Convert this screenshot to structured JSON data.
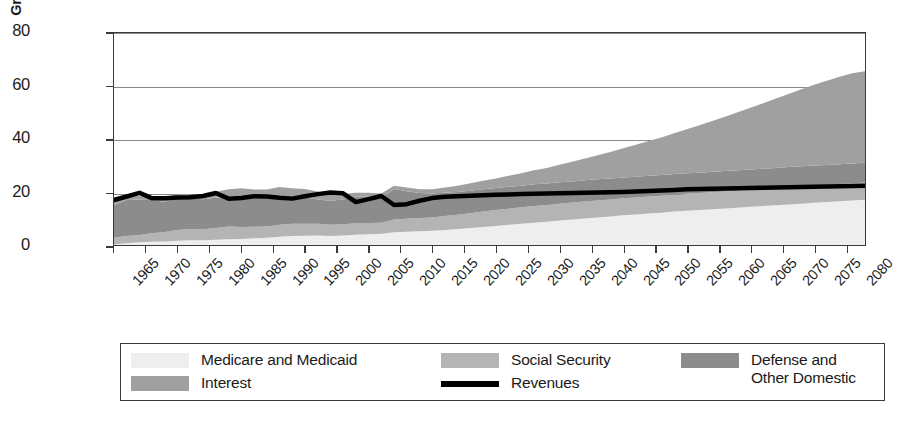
{
  "chart_data": {
    "type": "area",
    "title": "",
    "xlabel": "",
    "ylabel": "Percentage of\nGross Domestic Product",
    "ylabel_line1": "Percentage of",
    "ylabel_line2": "Gross Domestic Product",
    "xlim": [
      1965,
      2083
    ],
    "ylim": [
      0,
      80
    ],
    "grid": true,
    "stacked": true,
    "legend_position": "below-plot",
    "y_ticks": [
      0,
      20,
      40,
      60,
      80
    ],
    "x_ticks": [
      1965,
      1970,
      1975,
      1980,
      1985,
      1990,
      1995,
      2000,
      2005,
      2010,
      2015,
      2020,
      2025,
      2030,
      2035,
      2040,
      2045,
      2050,
      2055,
      2060,
      2065,
      2070,
      2075,
      2080
    ],
    "colors": {
      "medicare_and_medicaid": "#eeeeee",
      "social_security": "#b4b4b4",
      "defense_and_other_domestic": "#8c8c8c",
      "interest": "#a0a0a0",
      "revenues": "#000000",
      "gridline": "#8a8a8a",
      "frame": "#3a3a3a"
    },
    "x": [
      1965,
      1967,
      1969,
      1971,
      1973,
      1975,
      1977,
      1979,
      1981,
      1983,
      1985,
      1987,
      1989,
      1991,
      1993,
      1995,
      1997,
      1999,
      2001,
      2003,
      2005,
      2007,
      2009,
      2011,
      2013,
      2015,
      2017,
      2019,
      2021,
      2023,
      2025,
      2027,
      2029,
      2031,
      2033,
      2035,
      2037,
      2039,
      2041,
      2043,
      2045,
      2047,
      2049,
      2051,
      2053,
      2055,
      2057,
      2059,
      2061,
      2063,
      2065,
      2067,
      2069,
      2071,
      2073,
      2075,
      2077,
      2079,
      2081,
      2083
    ],
    "series": [
      {
        "name": "Medicare and Medicaid",
        "stack_order": 1,
        "color": "#eeeeee",
        "values": [
          0.2,
          0.7,
          1.0,
          1.2,
          1.3,
          1.6,
          1.8,
          1.8,
          2.0,
          2.2,
          2.3,
          2.5,
          2.7,
          3.1,
          3.4,
          3.5,
          3.6,
          3.4,
          3.6,
          3.9,
          4.1,
          4.2,
          4.8,
          5.0,
          5.2,
          5.4,
          5.7,
          6.0,
          6.4,
          6.8,
          7.2,
          7.6,
          8.0,
          8.4,
          8.8,
          9.2,
          9.6,
          10.0,
          10.4,
          10.8,
          11.2,
          11.5,
          11.9,
          12.2,
          12.6,
          12.9,
          13.2,
          13.5,
          13.8,
          14.1,
          14.4,
          14.7,
          15.0,
          15.3,
          15.6,
          15.9,
          16.2,
          16.5,
          16.8,
          17.1
        ]
      },
      {
        "name": "Social Security",
        "stack_order": 2,
        "color": "#b4b4b4",
        "values": [
          2.5,
          2.7,
          2.8,
          3.2,
          3.6,
          4.1,
          4.2,
          4.1,
          4.4,
          4.8,
          4.5,
          4.4,
          4.3,
          4.5,
          4.6,
          4.5,
          4.4,
          4.2,
          4.2,
          4.3,
          4.2,
          4.2,
          4.8,
          4.9,
          5.0,
          5.0,
          5.2,
          5.4,
          5.6,
          5.8,
          6.0,
          6.1,
          6.2,
          6.3,
          6.3,
          6.4,
          6.4,
          6.4,
          6.4,
          6.4,
          6.4,
          6.4,
          6.4,
          6.4,
          6.4,
          6.4,
          6.4,
          6.4,
          6.4,
          6.4,
          6.5,
          6.5,
          6.5,
          6.5,
          6.5,
          6.5,
          6.5,
          6.5,
          6.5,
          6.5
        ]
      },
      {
        "name": "Defense and Other Domestic",
        "stack_order": 3,
        "color": "#8c8c8c",
        "values": [
          12.4,
          13.6,
          13.4,
          12.5,
          11.4,
          12.1,
          11.6,
          11.4,
          11.4,
          11.4,
          11.5,
          11.0,
          10.7,
          11.0,
          10.4,
          9.9,
          9.2,
          9.1,
          9.4,
          10.1,
          9.9,
          9.3,
          11.5,
          10.4,
          9.4,
          9.0,
          8.8,
          8.6,
          8.5,
          8.4,
          8.3,
          8.3,
          8.2,
          8.2,
          8.1,
          8.1,
          8.0,
          8.0,
          8.0,
          7.9,
          7.9,
          7.9,
          7.8,
          7.8,
          7.8,
          7.8,
          7.7,
          7.7,
          7.7,
          7.7,
          7.6,
          7.6,
          7.6,
          7.6,
          7.6,
          7.6,
          7.5,
          7.5,
          7.5,
          7.5
        ]
      },
      {
        "name": "Interest",
        "stack_order": 4,
        "color": "#a0a0a0",
        "values": [
          1.3,
          1.3,
          1.4,
          1.4,
          1.4,
          1.5,
          1.5,
          1.7,
          2.3,
          2.6,
          3.1,
          3.0,
          3.2,
          3.3,
          3.0,
          3.2,
          3.0,
          2.5,
          2.0,
          1.4,
          1.5,
          1.7,
          1.3,
          1.4,
          1.4,
          1.6,
          2.0,
          2.4,
          2.8,
          3.2,
          3.6,
          4.1,
          4.7,
          5.3,
          5.9,
          6.6,
          7.4,
          8.2,
          9.1,
          10.0,
          11.0,
          12.0,
          13.1,
          14.2,
          15.4,
          16.6,
          17.9,
          19.2,
          20.5,
          21.9,
          23.3,
          24.7,
          26.2,
          27.6,
          29.1,
          30.5,
          31.8,
          33.0,
          34.0,
          34.5
        ]
      }
    ],
    "line_series": {
      "name": "Revenues",
      "color": "#000000",
      "values": [
        17.0,
        18.3,
        19.7,
        17.6,
        17.6,
        17.9,
        18.0,
        18.5,
        19.6,
        17.5,
        17.7,
        18.4,
        18.3,
        17.8,
        17.5,
        18.4,
        19.2,
        19.8,
        19.5,
        16.2,
        17.3,
        18.5,
        15.1,
        15.4,
        16.7,
        17.7,
        18.2,
        18.4,
        18.6,
        18.8,
        19.0,
        19.1,
        19.2,
        19.3,
        19.4,
        19.5,
        19.6,
        19.7,
        19.8,
        19.9,
        20.0,
        20.2,
        20.4,
        20.6,
        20.8,
        21.0,
        21.1,
        21.2,
        21.3,
        21.4,
        21.5,
        21.6,
        21.7,
        21.8,
        21.9,
        22.0,
        22.1,
        22.2,
        22.3,
        22.4
      ]
    },
    "legend": [
      {
        "label": "Medicare and Medicaid",
        "color": "#eeeeee",
        "type": "area",
        "column": 1,
        "row": 1
      },
      {
        "label": "Interest",
        "color": "#a0a0a0",
        "type": "area",
        "column": 1,
        "row": 2
      },
      {
        "label": "Social Security",
        "color": "#b4b4b4",
        "type": "area",
        "column": 2,
        "row": 1
      },
      {
        "label": "Revenues",
        "color": "#000000",
        "type": "line",
        "column": 2,
        "row": 2
      },
      {
        "label": "Defense and\nOther Domestic",
        "color": "#8c8c8c",
        "type": "area",
        "column": 3,
        "row": 1
      }
    ]
  }
}
